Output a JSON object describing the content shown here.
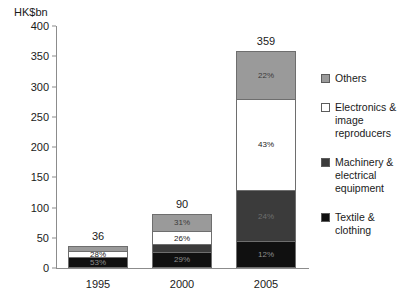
{
  "chart_data": {
    "type": "bar",
    "title": "",
    "subtitle": "",
    "xlabel": "",
    "ylabel": "HK$bn",
    "ylim": [
      0,
      400
    ],
    "yticks": [
      0,
      50,
      100,
      150,
      200,
      250,
      300,
      350,
      400
    ],
    "ytick_labels": [
      "0",
      "50",
      "100",
      "150",
      "200",
      "250",
      "300",
      "350",
      "400"
    ],
    "grid": false,
    "stacked": true,
    "legend_position": "right",
    "categories": [
      "1995",
      "2000",
      "2005"
    ],
    "totals": [
      36,
      90,
      359
    ],
    "total_labels": [
      "36",
      "90",
      "359"
    ],
    "series": [
      {
        "name": "Others",
        "color": "#9a9a9a",
        "percent_values": [
          19,
          31,
          22
        ],
        "percent_labels": [
          "",
          "31%",
          "22%"
        ]
      },
      {
        "name": "Electronics & image reproducers",
        "color": "#ffffff",
        "percent_values": [
          28,
          26,
          43
        ],
        "percent_labels": [
          "28%",
          "26%",
          "43%"
        ]
      },
      {
        "name": "Machinery & electrical equipment",
        "color": "#3b3b3b",
        "percent_values": [
          0,
          14,
          24
        ],
        "percent_labels": [
          "",
          "",
          "24%"
        ]
      },
      {
        "name": "Textile & clothing",
        "color": "#101010",
        "percent_values": [
          53,
          29,
          12
        ],
        "percent_labels": [
          "53%",
          "29%",
          "12%"
        ]
      }
    ]
  },
  "legend": {
    "items": [
      {
        "label": "Others",
        "swatch": "sw-others"
      },
      {
        "label": "Electronics & image reproducers",
        "swatch": "sw-electronics"
      },
      {
        "label": "Machinery & electrical equipment",
        "swatch": "sw-machinery"
      },
      {
        "label": "Textile & clothing",
        "swatch": "sw-textile"
      }
    ]
  }
}
